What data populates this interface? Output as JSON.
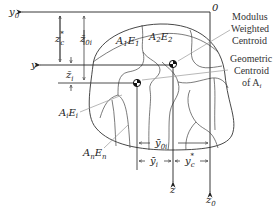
{
  "diagram": {
    "type": "cross-section centroid diagram",
    "axes": {
      "y0": {
        "base": "y",
        "sub": "0"
      },
      "z0": {
        "base": "z",
        "sub": "0"
      },
      "y": {
        "base": "y"
      },
      "z": {
        "base": "z"
      },
      "origin": "0"
    },
    "regions": {
      "a1e1": {
        "A": "A",
        "a_sub": "1",
        "E": "E",
        "e_sub": "1"
      },
      "a2e2": {
        "A": "A",
        "a_sub": "2",
        "E": "E",
        "e_sub": "2"
      },
      "aiei": {
        "A": "A",
        "a_sub": "i",
        "E": "E",
        "e_sub": "i"
      },
      "anen": {
        "A": "A",
        "a_sub": "n",
        "E": "E",
        "e_sub": "n"
      }
    },
    "callouts": {
      "modulus_centroid": [
        "Modulus",
        "Weighted",
        "Centroid"
      ],
      "geometric_centroid": [
        "Geometric",
        "Centroid",
        "of A"
      ],
      "geometric_centroid_sub": "i"
    },
    "dimensions": {
      "zc_star": {
        "base": "z",
        "sub": "c",
        "sup": "*"
      },
      "z0i_bar": {
        "base": "z̄",
        "sub": "0i"
      },
      "zi_bar": {
        "base": "z̄",
        "sub": "i"
      },
      "y0i_bar": {
        "base": "ȳ",
        "sub": "0i"
      },
      "yi_bar": {
        "base": "ȳ",
        "sub": "i"
      },
      "yc_star": {
        "base": "y",
        "sub": "c",
        "sup": "*"
      }
    },
    "colors": {
      "line": "#333333",
      "callout_line": "#999999",
      "background": "#ffffff"
    }
  }
}
